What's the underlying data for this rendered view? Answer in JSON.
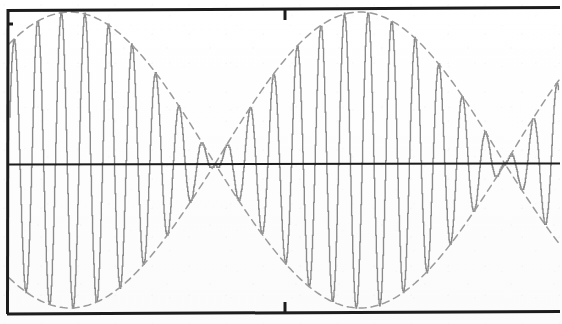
{
  "document": {
    "kind": "scanned-plot",
    "title": "Amplitude-modulated waveform",
    "background_color": "#ffffff",
    "frame_color": "#1a1a1a",
    "trace_color": "#8a8a8a",
    "envelope_color": "#9a9a9a"
  },
  "frame": {
    "left_x": 8,
    "right_x": 560,
    "top_y": 9,
    "bottom_y": 313,
    "axis_y": 164,
    "border_width": 3,
    "axis_width": 2,
    "left_axis_visible": true,
    "right_axis_visible": false,
    "top_border_visible": true,
    "bottom_border_visible": true
  },
  "ticks": {
    "length": 11,
    "width": 3,
    "top": [
      {
        "x": 285,
        "label": ""
      }
    ],
    "bottom": [
      {
        "x": 285,
        "label": ""
      }
    ],
    "left": [
      {
        "y": 24,
        "label": ""
      }
    ]
  },
  "chart_data": {
    "type": "line",
    "title": "Amplitude-modulated waveform",
    "subtitle": "",
    "xlabel": "",
    "ylabel": "",
    "xlim": [
      0,
      562
    ],
    "ylim": [
      -1.12,
      1.12
    ],
    "grid": false,
    "legend": null,
    "annotations": [],
    "description": "Aliased high-frequency carrier modulated by a sinusoidal envelope; two full beat periods with envelope nodes where amplitude collapses to zero.",
    "carrier": {
      "samples_per_screen": 96,
      "alias_period_px": 23.6,
      "phase_deg": 0
    },
    "envelope": {
      "shape": "abs-sine",
      "node_x": [
        215,
        505
      ],
      "antinode_x": [
        68,
        345
      ],
      "period_px": 290,
      "peak_amplitude": 1.0,
      "top_y_at_peak": 12,
      "bottom_y_at_peak": 308
    },
    "series": [
      {
        "name": "modulated-signal",
        "color": "#8a8a8a",
        "style": "stepped",
        "values": [
          1.0,
          -0.98,
          0.95,
          -0.91,
          0.86,
          -0.8,
          0.73,
          -0.66,
          0.58,
          -0.49,
          0.4,
          -0.31,
          0.21,
          -0.11,
          0.02,
          0.08,
          -0.18,
          0.28,
          -0.37,
          0.46,
          -0.55,
          0.63,
          -0.71,
          0.77,
          -0.83,
          0.88,
          -0.93,
          0.96,
          -0.99,
          1.0,
          -1.0,
          0.99,
          -0.96,
          0.93,
          -0.88,
          0.83,
          -0.77,
          0.7,
          -0.63,
          0.55,
          -0.46,
          0.37,
          -0.28,
          0.18,
          -0.08,
          -0.02,
          0.12,
          -0.21,
          0.31,
          -0.4,
          0.49,
          -0.58,
          0.66,
          -0.73,
          0.8,
          -0.86,
          0.91,
          -0.95,
          0.98,
          -1.0,
          1.0,
          -0.99,
          0.97,
          -0.94,
          0.9,
          -0.85,
          0.79,
          -0.72,
          0.64,
          -0.56,
          0.47,
          -0.38,
          0.28,
          -0.18,
          0.08,
          0.02,
          -0.12,
          0.22,
          -0.32,
          0.41,
          -0.5,
          0.59,
          -0.67,
          0.74,
          -0.81,
          0.87,
          -0.92,
          0.96,
          -0.98,
          1.0,
          -1.0,
          0.98,
          -0.96,
          0.92,
          -0.87,
          0.81
        ]
      },
      {
        "name": "upper-envelope",
        "color": "#9a9a9a",
        "style": "dashed",
        "values": [
          1.0,
          0.62,
          0.05,
          0.7,
          1.0,
          0.55,
          0.1,
          0.78,
          1.0
        ]
      },
      {
        "name": "lower-envelope",
        "color": "#9a9a9a",
        "style": "dashed",
        "values": [
          -1.0,
          -0.62,
          -0.05,
          -0.7,
          -1.0,
          -0.55,
          -0.1,
          -0.78,
          -1.0
        ]
      }
    ]
  }
}
